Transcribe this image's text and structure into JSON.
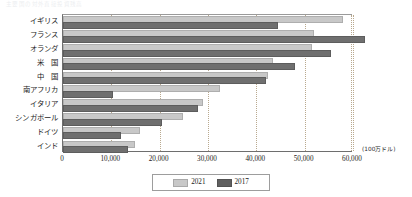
{
  "caption": "主要国の対外直接投資残高",
  "unit_label": "(100万ドル)",
  "legend": {
    "items": [
      {
        "label": "2021",
        "color": "#c8c8c8"
      },
      {
        "label": "2017",
        "color": "#5f5f5f"
      }
    ]
  },
  "axis": {
    "x_ticks": [
      "0",
      "10,000",
      "20,000",
      "30,000",
      "40,000",
      "50,000",
      "60,000"
    ],
    "x_tick_values": [
      0,
      10000,
      20000,
      30000,
      40000,
      50000,
      60000
    ]
  },
  "chart_data": {
    "type": "bar",
    "orientation": "horizontal",
    "title": "主要国の対外直接投資残高",
    "xlabel": "(100万ドル)",
    "ylabel": "",
    "xlim": [
      0,
      62000
    ],
    "grid": true,
    "legend_position": "bottom",
    "categories": [
      "イギリス",
      "フランス",
      "オランダ",
      "米　国",
      "中　国",
      "南アフリカ",
      "イタリア",
      "シンガポール",
      "ドイツ",
      "インド"
    ],
    "series": [
      {
        "name": "2021",
        "color": "#c8c8c8",
        "values": [
          57500,
          51500,
          51000,
          43000,
          42000,
          32000,
          28500,
          24500,
          15500,
          14500
        ]
      },
      {
        "name": "2017",
        "color": "#6f6f6f",
        "values": [
          44000,
          62000,
          55000,
          47500,
          41500,
          10000,
          27500,
          20000,
          11500,
          13000
        ]
      }
    ]
  }
}
